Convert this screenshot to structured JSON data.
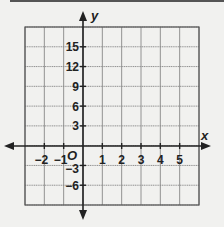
{
  "graph": {
    "x_axis_label": "x",
    "y_axis_label": "y",
    "origin_label": "O",
    "x_ticks": [
      {
        "value": -2,
        "label": "−2"
      },
      {
        "value": -1,
        "label": "−1"
      },
      {
        "value": 1,
        "label": "1"
      },
      {
        "value": 2,
        "label": "2"
      },
      {
        "value": 3,
        "label": "3"
      },
      {
        "value": 4,
        "label": "4"
      },
      {
        "value": 5,
        "label": "5"
      }
    ],
    "y_ticks": [
      {
        "value": 15,
        "label": "15"
      },
      {
        "value": 12,
        "label": "12"
      },
      {
        "value": 9,
        "label": "9"
      },
      {
        "value": 6,
        "label": "6"
      },
      {
        "value": 3,
        "label": "3"
      },
      {
        "value": -3,
        "label": "−3"
      },
      {
        "value": -6,
        "label": "−6"
      }
    ],
    "x_range": [
      -3,
      6
    ],
    "y_range": [
      -9,
      18
    ],
    "x_step": 1,
    "y_step": 3,
    "colors": {
      "background": "#f1f1ef",
      "grid": "#888888",
      "axis": "#222222"
    }
  }
}
